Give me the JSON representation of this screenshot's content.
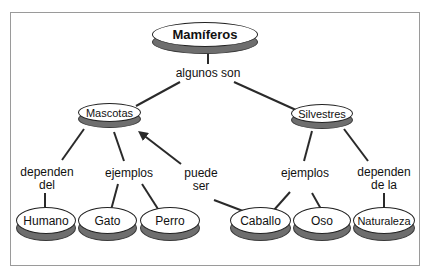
{
  "diagram": {
    "root": {
      "label": "Mamíferos"
    },
    "link_root": {
      "label": "algunos son"
    },
    "categories": [
      {
        "label": "Mascotas"
      },
      {
        "label": "Silvestres"
      }
    ],
    "links": {
      "mascotas_depend": {
        "line1": "dependen",
        "line2": "del"
      },
      "mascotas_ejemplos": {
        "label": "ejemplos"
      },
      "puede_ser": {
        "line1": "puede",
        "line2": "ser"
      },
      "silvestres_ejemplos": {
        "label": "ejemplos"
      },
      "silvestres_depend": {
        "line1": "dependen",
        "line2": "de la"
      }
    },
    "leaves": [
      {
        "label": "Humano"
      },
      {
        "label": "Gato"
      },
      {
        "label": "Perro"
      },
      {
        "label": "Caballo"
      },
      {
        "label": "Oso"
      },
      {
        "label": "Naturaleza"
      }
    ],
    "colors": {
      "line": "#2a2a2a",
      "shadow": "#6e6e6e",
      "frame": "#9a9a9a"
    }
  }
}
